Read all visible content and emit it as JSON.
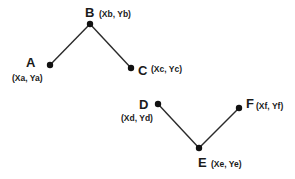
{
  "diagram": {
    "colors": {
      "line": "#2a2a2a",
      "point": "#111111",
      "text": "#1a1a1a",
      "background": "#ffffff"
    },
    "points": [
      {
        "id": "A",
        "name": "A",
        "coord": "(Xa, Ya)",
        "x": 50,
        "y": 65
      },
      {
        "id": "B",
        "name": "B",
        "coord": "(Xb, Yb)",
        "x": 90,
        "y": 24
      },
      {
        "id": "C",
        "name": "C",
        "coord": "(Xc, Yc)",
        "x": 131,
        "y": 68
      },
      {
        "id": "D",
        "name": "D",
        "coord": "(Xd, Yd)",
        "x": 158,
        "y": 104
      },
      {
        "id": "E",
        "name": "E",
        "coord": "(Xe, Ye)",
        "x": 199,
        "y": 148
      },
      {
        "id": "F",
        "name": "F",
        "coord": "(Xf, Yf)",
        "x": 239,
        "y": 108
      }
    ],
    "segments": [
      {
        "from": "A",
        "to": "B"
      },
      {
        "from": "B",
        "to": "C"
      },
      {
        "from": "D",
        "to": "E"
      },
      {
        "from": "E",
        "to": "F"
      }
    ]
  }
}
